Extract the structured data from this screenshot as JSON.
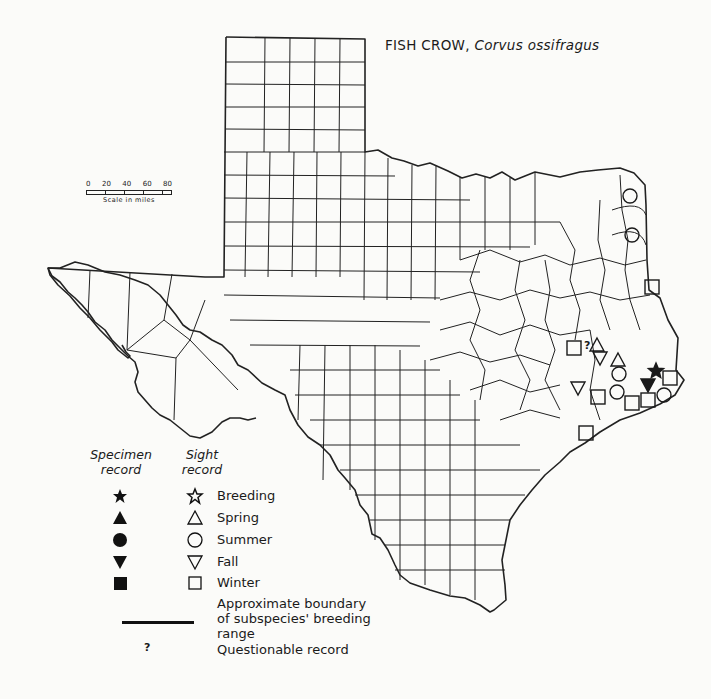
{
  "title": {
    "common_name": "FISH CROW,",
    "scientific_name": "Corvus ossifragus"
  },
  "scale": {
    "ticks": [
      "0",
      "20",
      "40",
      "60",
      "80"
    ],
    "caption": "Scale in miles"
  },
  "legend": {
    "specimen_header_line1": "Specimen",
    "specimen_header_line2": "record",
    "sight_header_line1": "Sight",
    "sight_header_line2": "record",
    "entries": [
      {
        "label": "Breeding",
        "specimen_icon": "filled-star",
        "sight_icon": "open-star"
      },
      {
        "label": "Spring",
        "specimen_icon": "filled-triangle-up",
        "sight_icon": "open-triangle-up"
      },
      {
        "label": "Summer",
        "specimen_icon": "filled-circle",
        "sight_icon": "open-circle"
      },
      {
        "label": "Fall",
        "specimen_icon": "filled-triangle-down",
        "sight_icon": "open-triangle-down"
      },
      {
        "label": "Winter",
        "specimen_icon": "filled-square",
        "sight_icon": "open-square"
      }
    ],
    "boundary_line1": "Approximate boundary",
    "boundary_line2": "of subspecies' breeding range",
    "questionable_symbol": "?",
    "questionable_label": "Questionable record"
  },
  "records": [
    {
      "type": "sight",
      "season": "summer",
      "x": 630,
      "y": 196
    },
    {
      "type": "sight",
      "season": "summer",
      "x": 632,
      "y": 235
    },
    {
      "type": "sight",
      "season": "winter",
      "x": 652,
      "y": 287
    },
    {
      "type": "sight",
      "season": "winter",
      "x": 574,
      "y": 348
    },
    {
      "type": "questionable",
      "season": "",
      "x": 587,
      "y": 345
    },
    {
      "type": "sight",
      "season": "spring",
      "x": 597,
      "y": 345
    },
    {
      "type": "sight",
      "season": "fall",
      "x": 600,
      "y": 358
    },
    {
      "type": "sight",
      "season": "spring",
      "x": 618,
      "y": 360
    },
    {
      "type": "sight",
      "season": "summer",
      "x": 619,
      "y": 374
    },
    {
      "type": "sight",
      "season": "fall",
      "x": 578,
      "y": 388
    },
    {
      "type": "sight",
      "season": "winter",
      "x": 598,
      "y": 397
    },
    {
      "type": "sight",
      "season": "summer",
      "x": 617,
      "y": 392
    },
    {
      "type": "sight",
      "season": "winter",
      "x": 632,
      "y": 403
    },
    {
      "type": "sight",
      "season": "winter",
      "x": 648,
      "y": 400
    },
    {
      "type": "specimen",
      "season": "breeding",
      "x": 656,
      "y": 371
    },
    {
      "type": "sight",
      "season": "winter",
      "x": 670,
      "y": 378
    },
    {
      "type": "specimen",
      "season": "fall",
      "x": 648,
      "y": 385
    },
    {
      "type": "sight",
      "season": "summer",
      "x": 664,
      "y": 395
    },
    {
      "type": "sight",
      "season": "winter",
      "x": 586,
      "y": 433
    }
  ],
  "colors": {
    "ink": "#1a1a1a",
    "paper": "#fbfbf9"
  }
}
